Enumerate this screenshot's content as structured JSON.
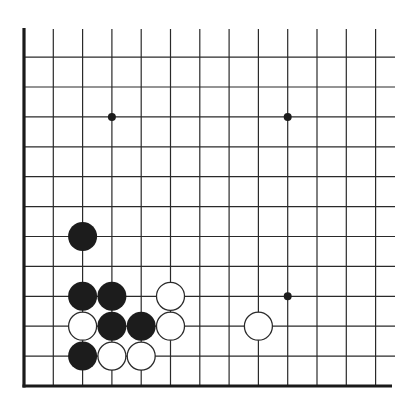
{
  "diagram": {
    "type": "go-board-fragment",
    "corner": "bottom-left",
    "colors": {
      "background": "#ffffff",
      "line": "#2a2a2a",
      "edge": "#1a1a1a",
      "black_stone": "#1c1c1c",
      "white_stone": "#ffffff",
      "white_outline": "#2a2a2a",
      "star_point": "#1c1c1c"
    },
    "grid": {
      "columns": 13,
      "rows": 12,
      "origin_x": 24,
      "bottom_y": 386,
      "col_spacing": 29.3,
      "row_spacing": 29.9,
      "line_extend_right": 395,
      "line_extend_top": 29
    },
    "star_points": [
      {
        "col": 3,
        "row": 9
      },
      {
        "col": 9,
        "row": 9
      },
      {
        "col": 9,
        "row": 3
      }
    ],
    "stones": [
      {
        "color": "black",
        "col": 2,
        "row": 5
      },
      {
        "color": "black",
        "col": 2,
        "row": 3
      },
      {
        "color": "black",
        "col": 3,
        "row": 3
      },
      {
        "color": "white",
        "col": 5,
        "row": 3
      },
      {
        "color": "white",
        "col": 2,
        "row": 2
      },
      {
        "color": "black",
        "col": 3,
        "row": 2
      },
      {
        "color": "black",
        "col": 4,
        "row": 2
      },
      {
        "color": "white",
        "col": 5,
        "row": 2
      },
      {
        "color": "black",
        "col": 2,
        "row": 1
      },
      {
        "color": "white",
        "col": 3,
        "row": 1
      },
      {
        "color": "white",
        "col": 4,
        "row": 1
      },
      {
        "color": "white",
        "col": 8,
        "row": 2
      }
    ],
    "stone_radius": 14.5,
    "star_radius": 4
  }
}
